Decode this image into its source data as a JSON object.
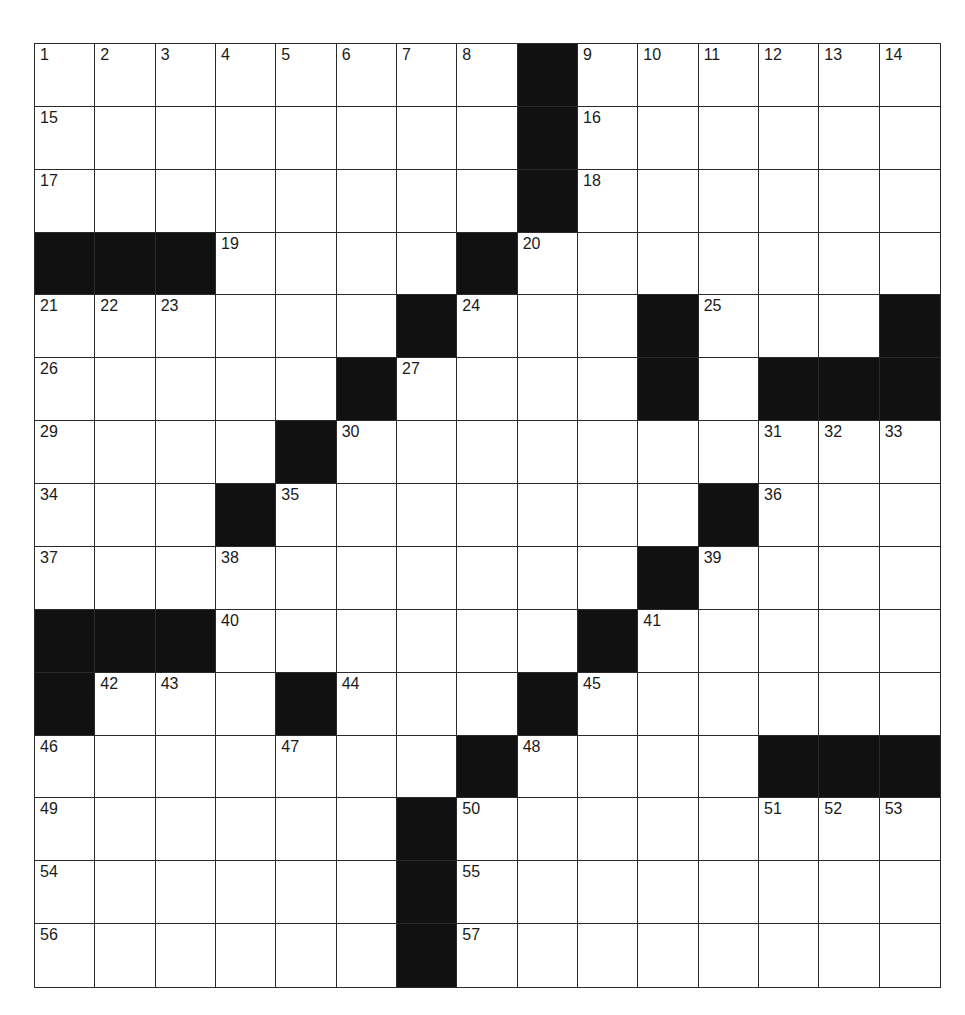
{
  "puzzle": {
    "rows": 15,
    "cols": 15,
    "colors": {
      "block": "#111111",
      "cell": "#ffffff",
      "line": "#2a2a2a",
      "number": "#1a1a1a"
    },
    "layout": [
      "........#......",
      "........#......",
      "........#......",
      "###....#.......",
      "......#...#...#",
      ".....#....#.###",
      "....#..........",
      "...#.......#...",
      "..........#....",
      "###......#.....",
      "#...#...#......",
      ".......#....###",
      "......#........",
      "......#........",
      "......#........"
    ],
    "numbers": [
      {
        "r": 0,
        "c": 0,
        "n": "1"
      },
      {
        "r": 0,
        "c": 1,
        "n": "2"
      },
      {
        "r": 0,
        "c": 2,
        "n": "3"
      },
      {
        "r": 0,
        "c": 3,
        "n": "4"
      },
      {
        "r": 0,
        "c": 4,
        "n": "5"
      },
      {
        "r": 0,
        "c": 5,
        "n": "6"
      },
      {
        "r": 0,
        "c": 6,
        "n": "7"
      },
      {
        "r": 0,
        "c": 7,
        "n": "8"
      },
      {
        "r": 0,
        "c": 9,
        "n": "9"
      },
      {
        "r": 0,
        "c": 10,
        "n": "10"
      },
      {
        "r": 0,
        "c": 11,
        "n": "11"
      },
      {
        "r": 0,
        "c": 12,
        "n": "12"
      },
      {
        "r": 0,
        "c": 13,
        "n": "13"
      },
      {
        "r": 0,
        "c": 14,
        "n": "14"
      },
      {
        "r": 1,
        "c": 0,
        "n": "15"
      },
      {
        "r": 1,
        "c": 9,
        "n": "16"
      },
      {
        "r": 2,
        "c": 0,
        "n": "17"
      },
      {
        "r": 2,
        "c": 9,
        "n": "18"
      },
      {
        "r": 3,
        "c": 3,
        "n": "19"
      },
      {
        "r": 3,
        "c": 8,
        "n": "20"
      },
      {
        "r": 4,
        "c": 0,
        "n": "21"
      },
      {
        "r": 4,
        "c": 1,
        "n": "22"
      },
      {
        "r": 4,
        "c": 2,
        "n": "23"
      },
      {
        "r": 4,
        "c": 7,
        "n": "24"
      },
      {
        "r": 4,
        "c": 11,
        "n": "25"
      },
      {
        "r": 5,
        "c": 0,
        "n": "26"
      },
      {
        "r": 5,
        "c": 6,
        "n": "27"
      },
      {
        "r": 5,
        "c": 10,
        "n": "28"
      },
      {
        "r": 6,
        "c": 0,
        "n": "29"
      },
      {
        "r": 6,
        "c": 5,
        "n": "30"
      },
      {
        "r": 6,
        "c": 12,
        "n": "31"
      },
      {
        "r": 6,
        "c": 13,
        "n": "32"
      },
      {
        "r": 6,
        "c": 14,
        "n": "33"
      },
      {
        "r": 7,
        "c": 0,
        "n": "34"
      },
      {
        "r": 7,
        "c": 4,
        "n": "35"
      },
      {
        "r": 7,
        "c": 12,
        "n": "36"
      },
      {
        "r": 8,
        "c": 0,
        "n": "37"
      },
      {
        "r": 8,
        "c": 3,
        "n": "38"
      },
      {
        "r": 8,
        "c": 11,
        "n": "39"
      },
      {
        "r": 9,
        "c": 3,
        "n": "40"
      },
      {
        "r": 9,
        "c": 10,
        "n": "41"
      },
      {
        "r": 10,
        "c": 1,
        "n": "42"
      },
      {
        "r": 10,
        "c": 2,
        "n": "43"
      },
      {
        "r": 10,
        "c": 5,
        "n": "44"
      },
      {
        "r": 10,
        "c": 9,
        "n": "45"
      },
      {
        "r": 11,
        "c": 0,
        "n": "46"
      },
      {
        "r": 11,
        "c": 4,
        "n": "47"
      },
      {
        "r": 11,
        "c": 8,
        "n": "48"
      },
      {
        "r": 12,
        "c": 0,
        "n": "49"
      },
      {
        "r": 12,
        "c": 7,
        "n": "50"
      },
      {
        "r": 12,
        "c": 12,
        "n": "51"
      },
      {
        "r": 12,
        "c": 13,
        "n": "52"
      },
      {
        "r": 12,
        "c": 14,
        "n": "53"
      },
      {
        "r": 13,
        "c": 0,
        "n": "54"
      },
      {
        "r": 13,
        "c": 7,
        "n": "55"
      },
      {
        "r": 14,
        "c": 0,
        "n": "56"
      },
      {
        "r": 14,
        "c": 7,
        "n": "57"
      }
    ]
  }
}
